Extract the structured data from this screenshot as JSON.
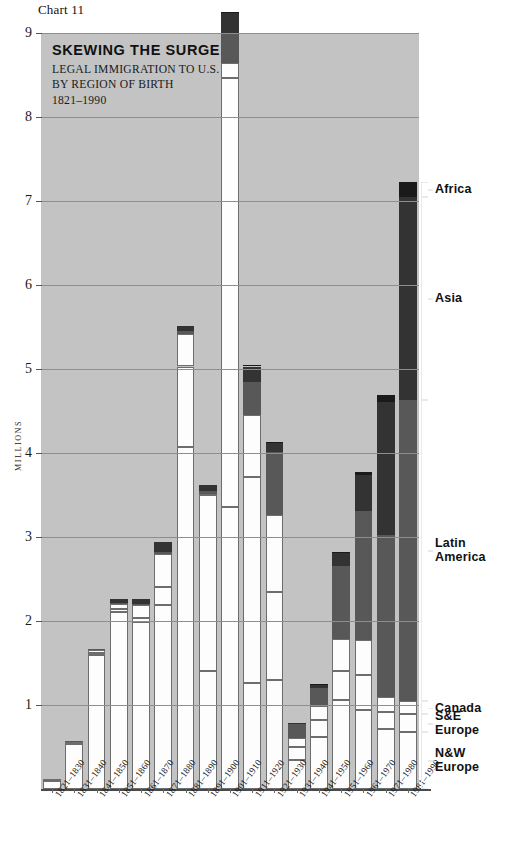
{
  "figure": {
    "caption": "Chart 11"
  },
  "title": {
    "main": "SKEWING THE SURGE",
    "line1": "LEGAL IMMIGRATION TO U.S.",
    "line2": "BY REGION OF BIRTH",
    "line3": "1821–1990"
  },
  "colors": {
    "plot_background": "#c3c3c3",
    "gridline": "#8e8e8e",
    "nw_europe": "#fdfdfd",
    "se_europe": "#fdfdfd",
    "canada": "#fdfdfd",
    "latin_america": "#585858",
    "asia": "#333333",
    "africa": "#1a1a1a",
    "bracket": "#e9e9e9",
    "text": "#111111"
  },
  "legend": {
    "position": "right-brackets",
    "entries": [
      {
        "label": "Africa",
        "key": "africa"
      },
      {
        "label": "Asia",
        "key": "asia"
      },
      {
        "label": "Latin\nAmerica",
        "key": "latin_america"
      },
      {
        "label": "Canada",
        "key": "canada"
      },
      {
        "label": "S&E\nEurope",
        "key": "se_europe"
      },
      {
        "label": "N&W\nEurope",
        "key": "nw_europe"
      }
    ]
  },
  "chart_data": {
    "type": "bar",
    "stacked": true,
    "title": "SKEWING THE SURGE",
    "subtitle": "LEGAL IMMIGRATION TO U.S. BY REGION OF BIRTH 1821–1990",
    "xlabel": "",
    "ylabel": "MILLIONS",
    "ylim": [
      0,
      9
    ],
    "yticks": [
      1,
      2,
      3,
      4,
      5,
      6,
      7,
      8,
      9
    ],
    "ytick_labels": [
      "1",
      "2",
      "3",
      "4",
      "5",
      "6",
      "7",
      "8",
      "9"
    ],
    "grid": true,
    "grid_axis": "y",
    "units": "millions of immigrants",
    "categories": [
      "1821–1830",
      "1831–1840",
      "1841–1850",
      "1851–1860",
      "1861–1870",
      "1871–1880",
      "1881–1890",
      "1891–1900",
      "1901–1910",
      "1911–1920",
      "1921–1930",
      "1931–1940",
      "1941–1950",
      "1951–1960",
      "1961–1970",
      "1971–1980",
      "1981–1990"
    ],
    "series": [
      {
        "name": "N&W Europe",
        "values": [
          0.1,
          0.53,
          1.6,
          2.11,
          1.99,
          2.19,
          4.07,
          1.41,
          3.36,
          1.26,
          1.3,
          0.35,
          0.62,
          1.06,
          0.94,
          0.72,
          0.68
        ]
      },
      {
        "name": "S&E Europe",
        "values": [
          0.0,
          0.01,
          0.02,
          0.03,
          0.05,
          0.21,
          0.96,
          2.09,
          5.1,
          2.45,
          1.04,
          0.15,
          0.2,
          0.35,
          0.42,
          0.2,
          0.21
        ]
      },
      {
        "name": "Canada",
        "values": [
          0.01,
          0.02,
          0.03,
          0.06,
          0.15,
          0.4,
          0.39,
          0.01,
          0.18,
          0.74,
          0.92,
          0.11,
          0.17,
          0.38,
          0.41,
          0.17,
          0.16
        ]
      },
      {
        "name": "Latin America",
        "values": [
          0.0,
          0.01,
          0.02,
          0.02,
          0.01,
          0.02,
          0.03,
          0.04,
          0.36,
          0.39,
          0.75,
          0.16,
          0.21,
          0.87,
          1.54,
          1.93,
          3.58
        ]
      },
      {
        "name": "Asia",
        "values": [
          0.0,
          0.0,
          0.0,
          0.04,
          0.06,
          0.12,
          0.06,
          0.07,
          0.24,
          0.19,
          0.11,
          0.02,
          0.04,
          0.15,
          0.43,
          1.59,
          2.42
        ]
      },
      {
        "name": "Africa",
        "values": [
          0.0,
          0.0,
          0.0,
          0.0,
          0.0,
          0.0,
          0.0,
          0.0,
          0.01,
          0.01,
          0.01,
          0.0,
          0.01,
          0.01,
          0.03,
          0.08,
          0.18
        ]
      }
    ],
    "totals": [
      0.11,
      0.57,
      1.67,
      2.36,
      2.25,
      2.94,
      5.51,
      3.62,
      9.25,
      5.04,
      4.13,
      0.79,
      1.25,
      2.82,
      3.77,
      4.69,
      7.23
    ],
    "peak": {
      "category": "1901–1910",
      "value": 8.8
    }
  }
}
